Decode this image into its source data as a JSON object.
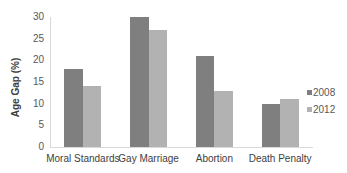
{
  "chart_data": {
    "type": "bar",
    "title": "",
    "xlabel": "",
    "ylabel": "Age Gap (%)",
    "ylim": [
      0,
      30
    ],
    "yticks": [
      0,
      5,
      10,
      15,
      20,
      25,
      30
    ],
    "categories": [
      "Moral Standards",
      "Gay Marriage",
      "Abortion",
      "Death Penalty"
    ],
    "series": [
      {
        "name": "2008",
        "color": "#7f7f7f",
        "values": [
          18,
          30,
          21,
          10
        ]
      },
      {
        "name": "2012",
        "color": "#b2b2b2",
        "values": [
          14,
          27,
          13,
          11
        ]
      }
    ],
    "grid": false,
    "legend_position": "right"
  }
}
